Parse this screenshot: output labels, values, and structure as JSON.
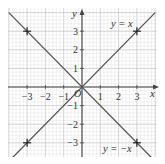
{
  "chart_data": {
    "type": "line",
    "title": "",
    "xlabel": "x",
    "ylabel": "y",
    "origin_label": "O",
    "xlim": [
      -4,
      4
    ],
    "ylim": [
      -4,
      4
    ],
    "x_ticks": [
      -3,
      -2,
      -1,
      1,
      2,
      3
    ],
    "y_ticks": [
      -3,
      -2,
      -1,
      1,
      2,
      3
    ],
    "x_tick_labels": [
      "−3",
      "−2",
      "−1",
      "1",
      "2",
      "3"
    ],
    "y_tick_labels": [
      "−3",
      "−2",
      "−1",
      "1",
      "2",
      "3"
    ],
    "grid": true,
    "minor_grid_per_unit": 5,
    "series": [
      {
        "name": "y = x",
        "label": "y = x",
        "x": [
          -4,
          4
        ],
        "y": [
          -4,
          4
        ],
        "marked_points": [
          [
            -3,
            -3
          ],
          [
            3,
            3
          ]
        ]
      },
      {
        "name": "y = −x",
        "label": "y = −x",
        "x": [
          -4,
          4
        ],
        "y": [
          4,
          -4
        ],
        "marked_points": [
          [
            -3,
            3
          ],
          [
            3,
            -3
          ]
        ]
      }
    ],
    "colors": {
      "line": "#555555",
      "axis": "#444444",
      "grid_major": "#c8c8c8",
      "grid_minor": "#e2e2e2",
      "marker": "#222222"
    }
  }
}
